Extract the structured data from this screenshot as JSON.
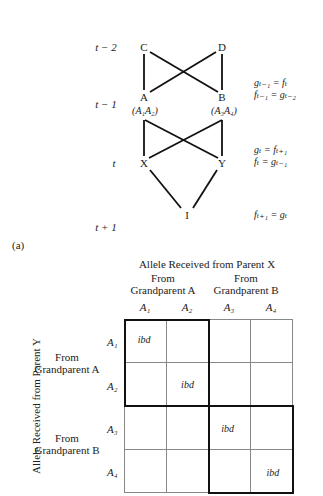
{
  "panel_label": "(a)",
  "pedigree": {
    "generations": [
      {
        "label": "t − 2"
      },
      {
        "label": "t − 1"
      },
      {
        "label": "t"
      },
      {
        "label": "t + 1"
      }
    ],
    "nodes": {
      "C": "C",
      "D": "D",
      "A": "A",
      "B": "B",
      "A_genotype": "(A₁A₂)",
      "B_genotype": "(A₃A₄)",
      "X": "X",
      "Y": "Y",
      "I": "I"
    },
    "edges": [
      [
        "C",
        "A"
      ],
      [
        "C",
        "B"
      ],
      [
        "D",
        "A"
      ],
      [
        "D",
        "B"
      ],
      [
        "A",
        "X"
      ],
      [
        "A",
        "Y"
      ],
      [
        "B",
        "X"
      ],
      [
        "B",
        "Y"
      ],
      [
        "X",
        "I"
      ],
      [
        "Y",
        "I"
      ]
    ],
    "equations": {
      "gen_t_minus_1": [
        "gₜ₋₁ = fₜ",
        "fₜ₋₁ = gₜ₋₂"
      ],
      "gen_t": [
        "gₜ = fₜ₊₁",
        "fₜ = gₜ₋₁"
      ],
      "gen_t_plus_1": [
        "fₜ₊₁ = gₜ"
      ]
    }
  },
  "matrix": {
    "col_title": "Allele Received from Parent X",
    "row_title": "Allele Received from Parent Y",
    "col_groups": [
      {
        "line1": "From",
        "line2": "Grandparent A"
      },
      {
        "line1": "From",
        "line2": "Grandparent B"
      }
    ],
    "row_groups": [
      {
        "line1": "From",
        "line2": "Grandparent A"
      },
      {
        "line1": "From",
        "line2": "Grandparent B"
      }
    ],
    "col_alleles": [
      "A₁",
      "A₂",
      "A₃",
      "A₄"
    ],
    "row_alleles": [
      "A₁",
      "A₂",
      "A₃",
      "A₄"
    ],
    "cells": [
      [
        "ibd",
        "",
        "",
        ""
      ],
      [
        "",
        "ibd",
        "",
        ""
      ],
      [
        "",
        "",
        "ibd",
        ""
      ],
      [
        "",
        "",
        "",
        "ibd"
      ]
    ]
  }
}
